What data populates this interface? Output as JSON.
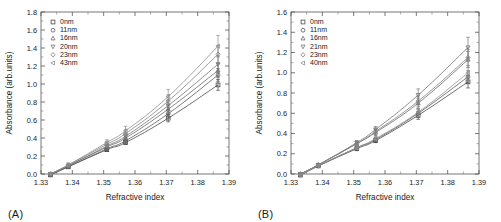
{
  "figure": {
    "panels": [
      {
        "panel_label": "(A)",
        "name": "panel-a"
      },
      {
        "panel_label": "(B)",
        "name": "panel-b"
      }
    ]
  },
  "chart_data": [
    {
      "type": "line",
      "title": "",
      "panel": "(A)",
      "xlabel": "Refractive index",
      "ylabel": "Absorbance (arb.units)",
      "xlim": [
        1.33,
        1.39
      ],
      "ylim": [
        0.0,
        1.8
      ],
      "xticks": [
        1.33,
        1.34,
        1.35,
        1.36,
        1.37,
        1.38,
        1.39
      ],
      "xtick_labels": [
        "1.33",
        "1.34",
        "1.35",
        "1.36",
        "1.37",
        "1.38",
        "1.39"
      ],
      "yticks": [
        0.0,
        0.2,
        0.4,
        0.6,
        0.8,
        1.0,
        1.2,
        1.4,
        1.6,
        1.8
      ],
      "ytick_labels": [
        "0.0",
        "0.2",
        "0.4",
        "0.6",
        "0.8",
        "1.0",
        "1.2",
        "1.4",
        "1.6",
        "1.8"
      ],
      "grid": false,
      "legend_position": "top-left",
      "x": [
        1.333,
        1.3387,
        1.351,
        1.357,
        1.3706,
        1.3865
      ],
      "series": [
        {
          "name": "0nm",
          "marker": "square",
          "values": [
            -0.01,
            0.08,
            0.27,
            0.35,
            0.62,
            0.99
          ],
          "errors": [
            0.01,
            0.01,
            0.02,
            0.02,
            0.04,
            0.06
          ]
        },
        {
          "name": "11nm",
          "marker": "circle",
          "values": [
            -0.01,
            0.08,
            0.28,
            0.37,
            0.67,
            1.1
          ],
          "errors": [
            0.01,
            0.01,
            0.02,
            0.03,
            0.05,
            0.07
          ]
        },
        {
          "name": "16nm",
          "marker": "triangle-up",
          "values": [
            0.0,
            0.09,
            0.3,
            0.4,
            0.72,
            1.15
          ],
          "errors": [
            0.01,
            0.01,
            0.02,
            0.03,
            0.05,
            0.08
          ]
        },
        {
          "name": "20nm",
          "marker": "triangle-down",
          "values": [
            0.0,
            0.09,
            0.31,
            0.42,
            0.76,
            1.22
          ],
          "errors": [
            0.01,
            0.01,
            0.02,
            0.03,
            0.06,
            0.09
          ]
        },
        {
          "name": "23nm",
          "marker": "diamond",
          "values": [
            0.0,
            0.1,
            0.33,
            0.45,
            0.81,
            1.33
          ],
          "errors": [
            0.01,
            0.02,
            0.03,
            0.04,
            0.07,
            0.1
          ]
        },
        {
          "name": "43nm",
          "marker": "left-triangle",
          "values": [
            0.0,
            0.1,
            0.35,
            0.48,
            0.86,
            1.42
          ],
          "errors": [
            0.01,
            0.02,
            0.03,
            0.05,
            0.08,
            0.12
          ]
        }
      ]
    },
    {
      "type": "line",
      "title": "",
      "panel": "(B)",
      "xlabel": "Refractive index",
      "ylabel": "Absorbance (arb.units)",
      "xlim": [
        1.33,
        1.39
      ],
      "ylim": [
        0.0,
        1.6
      ],
      "xticks": [
        1.33,
        1.34,
        1.35,
        1.36,
        1.37,
        1.38,
        1.39
      ],
      "xtick_labels": [
        "1.33",
        "1.34",
        "1.35",
        "1.36",
        "1.37",
        "1.38",
        "1.39"
      ],
      "yticks": [
        0.0,
        0.2,
        0.4,
        0.6,
        0.8,
        1.0,
        1.2,
        1.4,
        1.6
      ],
      "ytick_labels": [
        "0.0",
        "0.2",
        "0.4",
        "0.6",
        "0.8",
        "1.0",
        "1.2",
        "1.4",
        "1.6"
      ],
      "grid": false,
      "legend_position": "top-left",
      "x": [
        1.333,
        1.3387,
        1.351,
        1.357,
        1.3706,
        1.3865
      ],
      "series": [
        {
          "name": "0nm",
          "marker": "square",
          "values": [
            -0.01,
            0.08,
            0.25,
            0.33,
            0.58,
            0.91
          ],
          "errors": [
            0.01,
            0.01,
            0.02,
            0.02,
            0.04,
            0.06
          ]
        },
        {
          "name": "11nm",
          "marker": "circle",
          "values": [
            -0.01,
            0.08,
            0.26,
            0.34,
            0.6,
            0.96
          ],
          "errors": [
            0.01,
            0.01,
            0.02,
            0.02,
            0.04,
            0.06
          ]
        },
        {
          "name": "16nm",
          "marker": "triangle-up",
          "values": [
            0.0,
            0.09,
            0.3,
            0.41,
            0.7,
            1.13
          ],
          "errors": [
            0.01,
            0.01,
            0.02,
            0.03,
            0.05,
            0.08
          ]
        },
        {
          "name": "21nm",
          "marker": "triangle-down",
          "values": [
            0.0,
            0.09,
            0.31,
            0.44,
            0.78,
            1.25
          ],
          "errors": [
            0.01,
            0.01,
            0.02,
            0.03,
            0.06,
            0.1
          ]
        },
        {
          "name": "23nm",
          "marker": "diamond",
          "values": [
            0.0,
            0.09,
            0.3,
            0.42,
            0.72,
            1.15
          ],
          "errors": [
            0.01,
            0.01,
            0.02,
            0.03,
            0.05,
            0.08
          ]
        },
        {
          "name": "40nm",
          "marker": "left-triangle",
          "values": [
            -0.01,
            0.08,
            0.26,
            0.35,
            0.61,
            1.0
          ],
          "errors": [
            0.01,
            0.01,
            0.02,
            0.02,
            0.04,
            0.07
          ]
        }
      ]
    }
  ]
}
